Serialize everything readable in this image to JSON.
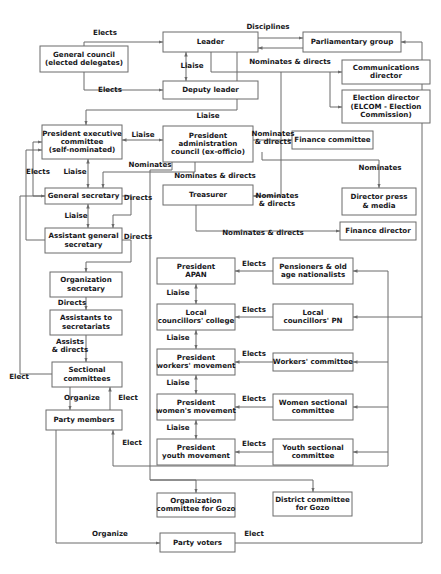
{
  "diagram": {
    "colors": {
      "background": "#ffffff",
      "box_stroke": "#6b6b6b",
      "box_fill": "#ffffff",
      "edge_stroke": "#6b6b6b",
      "text": "#17171b"
    },
    "nodes": [
      {
        "id": "general_council",
        "label": "General council\n(elected delegates)",
        "x": 40,
        "y": 46,
        "w": 88,
        "h": 26
      },
      {
        "id": "leader",
        "label": "Leader",
        "x": 163,
        "y": 32,
        "w": 95,
        "h": 20
      },
      {
        "id": "parliamentary_group",
        "label": "Parliamentary group",
        "x": 303,
        "y": 32,
        "w": 98,
        "h": 20
      },
      {
        "id": "deputy_leader",
        "label": "Deputy leader",
        "x": 163,
        "y": 81,
        "w": 95,
        "h": 18
      },
      {
        "id": "communications_dir",
        "label": "Communications\ndirector",
        "x": 342,
        "y": 60,
        "w": 88,
        "h": 24
      },
      {
        "id": "election_director",
        "label": "Election director\n(ELCOM - Election\nCommission)",
        "x": 342,
        "y": 90,
        "w": 88,
        "h": 33
      },
      {
        "id": "pres_exec_committee",
        "label": "President executive\ncommittee\n(self-nominated)",
        "x": 42,
        "y": 125,
        "w": 80,
        "h": 34
      },
      {
        "id": "pres_admin_council",
        "label": "President\nadministration\ncouncil (ex-officio)",
        "x": 163,
        "y": 126,
        "w": 90,
        "h": 36
      },
      {
        "id": "finance_committee",
        "label": "Finance committee",
        "x": 292,
        "y": 131,
        "w": 81,
        "h": 18
      },
      {
        "id": "general_secretary",
        "label": "General secretary",
        "x": 45,
        "y": 188,
        "w": 77,
        "h": 16
      },
      {
        "id": "treasurer",
        "label": "Treasurer",
        "x": 163,
        "y": 185,
        "w": 90,
        "h": 20
      },
      {
        "id": "director_press",
        "label": "Director press\n& media",
        "x": 342,
        "y": 188,
        "w": 74,
        "h": 27
      },
      {
        "id": "assistant_gen_sec",
        "label": "Assistant general\nsecretary",
        "x": 45,
        "y": 228,
        "w": 77,
        "h": 25
      },
      {
        "id": "finance_director",
        "label": "Finance director",
        "x": 340,
        "y": 222,
        "w": 76,
        "h": 18
      },
      {
        "id": "organization_secretary",
        "label": "Organization\nsecretary",
        "x": 50,
        "y": 272,
        "w": 72,
        "h": 25
      },
      {
        "id": "president_apan",
        "label": "President\nAPAN",
        "x": 157,
        "y": 258,
        "w": 78,
        "h": 26
      },
      {
        "id": "pensioners",
        "label": "Pensioners & old\nage nationalists",
        "x": 273,
        "y": 258,
        "w": 80,
        "h": 26
      },
      {
        "id": "assistants_secretariats",
        "label": "Assistants to\nsecretariats",
        "x": 50,
        "y": 310,
        "w": 72,
        "h": 25
      },
      {
        "id": "local_council_college",
        "label": "Local\ncouncillors' college",
        "x": 157,
        "y": 304,
        "w": 78,
        "h": 26
      },
      {
        "id": "local_councillors_pn",
        "label": "Local\ncouncillors' PN",
        "x": 273,
        "y": 304,
        "w": 80,
        "h": 26
      },
      {
        "id": "sectional_committees",
        "label": "Sectional\ncommittees",
        "x": 52,
        "y": 362,
        "w": 70,
        "h": 25
      },
      {
        "id": "pres_workers_movement",
        "label": "President\nworkers' movement",
        "x": 157,
        "y": 349,
        "w": 78,
        "h": 26
      },
      {
        "id": "workers_committee",
        "label": "Workers' committee",
        "x": 273,
        "y": 353,
        "w": 80,
        "h": 18
      },
      {
        "id": "party_members",
        "label": "Party members",
        "x": 46,
        "y": 410,
        "w": 76,
        "h": 20
      },
      {
        "id": "pres_womens_movement",
        "label": "President\nwomen's movement",
        "x": 157,
        "y": 394,
        "w": 78,
        "h": 26
      },
      {
        "id": "women_sectional",
        "label": "Women sectional\ncommittee",
        "x": 273,
        "y": 394,
        "w": 80,
        "h": 26
      },
      {
        "id": "pres_youth_movement",
        "label": "President\nyouth movement",
        "x": 157,
        "y": 439,
        "w": 78,
        "h": 26
      },
      {
        "id": "youth_sectional",
        "label": "Youth sectional\ncommittee",
        "x": 273,
        "y": 439,
        "w": 80,
        "h": 26
      },
      {
        "id": "org_committee_gozo",
        "label": "Organization\ncommittee for Gozo",
        "x": 157,
        "y": 493,
        "w": 78,
        "h": 24
      },
      {
        "id": "district_committee_gozo",
        "label": "District committee\nfor Gozo",
        "x": 273,
        "y": 492,
        "w": 79,
        "h": 24
      },
      {
        "id": "party_voters",
        "label": "Party voters",
        "x": 160,
        "y": 533,
        "w": 75,
        "h": 19
      }
    ],
    "edge_labels": [
      {
        "id": "elects-council-leader",
        "text": "Elects",
        "x": 105,
        "y": 33,
        "anchor": "mid"
      },
      {
        "id": "disciplines",
        "text": "Disciplines",
        "x": 268,
        "y": 27,
        "anchor": "mid"
      },
      {
        "id": "liaise-leader-deputy",
        "text": "Liaise",
        "x": 192,
        "y": 66,
        "anchor": "mid"
      },
      {
        "id": "nominates-directs-leader",
        "text": "Nominates & directs",
        "x": 290,
        "y": 62,
        "anchor": "mid"
      },
      {
        "id": "elects-council-deputy",
        "text": "Elects",
        "x": 110,
        "y": 90,
        "anchor": "mid"
      },
      {
        "id": "liaise-deputy-admin",
        "text": "Liaise",
        "x": 208,
        "y": 116,
        "anchor": "mid"
      },
      {
        "id": "liaise-exec-admin",
        "text": "Liaise",
        "x": 143,
        "y": 135,
        "anchor": "mid"
      },
      {
        "id": "nominates-directs-finance",
        "text": "Nominates\n& directs",
        "x": 273,
        "y": 138,
        "anchor": "mid"
      },
      {
        "id": "nominates-admin",
        "text": "Nominates",
        "x": 150,
        "y": 165,
        "anchor": "mid"
      },
      {
        "id": "nominates-directs-treasurer",
        "text": "Nominates & directs",
        "x": 215,
        "y": 176,
        "anchor": "mid"
      },
      {
        "id": "nominates-press",
        "text": "Nominates",
        "x": 380,
        "y": 168,
        "anchor": "mid"
      },
      {
        "id": "elects-exec",
        "text": "Elects",
        "x": 38,
        "y": 172,
        "anchor": "mid"
      },
      {
        "id": "liaise-exec-gensec",
        "text": "Liaise",
        "x": 75,
        "y": 172,
        "anchor": "mid"
      },
      {
        "id": "directs-gensec-1",
        "text": "Directs",
        "x": 138,
        "y": 198,
        "anchor": "mid"
      },
      {
        "id": "nominates-directs-treas2",
        "text": "Nominates\n& directs",
        "x": 277,
        "y": 200,
        "anchor": "mid"
      },
      {
        "id": "liaise-gensec-asst",
        "text": "Liaise",
        "x": 76,
        "y": 216,
        "anchor": "mid"
      },
      {
        "id": "directs-asst",
        "text": "Directs",
        "x": 138,
        "y": 237,
        "anchor": "mid"
      },
      {
        "id": "nominates-directs-findir",
        "text": "Nominates & directs",
        "x": 263,
        "y": 233,
        "anchor": "mid"
      },
      {
        "id": "elects-pensioners",
        "text": "Elects",
        "x": 254,
        "y": 264,
        "anchor": "mid"
      },
      {
        "id": "liaise-apan-college",
        "text": "Liaise",
        "x": 178,
        "y": 293,
        "anchor": "mid"
      },
      {
        "id": "directs-orgsec",
        "text": "Directs",
        "x": 72,
        "y": 303,
        "anchor": "mid"
      },
      {
        "id": "elects-localpn",
        "text": "Elects",
        "x": 254,
        "y": 310,
        "anchor": "mid"
      },
      {
        "id": "liaise-college-workers",
        "text": "Liaise",
        "x": 178,
        "y": 338,
        "anchor": "mid"
      },
      {
        "id": "assists-directs",
        "text": "Assists\n& directs",
        "x": 70,
        "y": 346,
        "anchor": "mid"
      },
      {
        "id": "elects-workers",
        "text": "Elects",
        "x": 254,
        "y": 354,
        "anchor": "mid"
      },
      {
        "id": "elect-sectional",
        "text": "Elect",
        "x": 19,
        "y": 377,
        "anchor": "mid"
      },
      {
        "id": "liaise-workers-women",
        "text": "Liaise",
        "x": 178,
        "y": 383,
        "anchor": "mid"
      },
      {
        "id": "organize-members",
        "text": "Organize",
        "x": 82,
        "y": 398,
        "anchor": "mid"
      },
      {
        "id": "elect-sectional2",
        "text": "Elect",
        "x": 128,
        "y": 398,
        "anchor": "mid"
      },
      {
        "id": "elects-women",
        "text": "Elects",
        "x": 254,
        "y": 399,
        "anchor": "mid"
      },
      {
        "id": "liaise-women-youth",
        "text": "Liaise",
        "x": 178,
        "y": 428,
        "anchor": "mid"
      },
      {
        "id": "elect-members",
        "text": "Elect",
        "x": 132,
        "y": 443,
        "anchor": "mid"
      },
      {
        "id": "elects-youth",
        "text": "Elects",
        "x": 254,
        "y": 444,
        "anchor": "mid"
      },
      {
        "id": "organize-voters",
        "text": "Organize",
        "x": 110,
        "y": 534,
        "anchor": "mid"
      },
      {
        "id": "elect-voters",
        "text": "Elect",
        "x": 254,
        "y": 534,
        "anchor": "mid"
      }
    ]
  }
}
